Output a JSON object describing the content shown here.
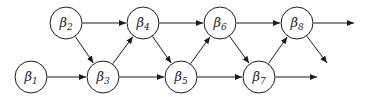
{
  "diagram": {
    "background_color": "#ffffff",
    "stroke_color": "#1c1c1c",
    "node_fill_color": "#ffffff",
    "node_radius": 16,
    "node_stroke_width": 1,
    "edge_stroke_width": 1,
    "label_font_size": 13,
    "subscript_font_size": 9,
    "canvas": {
      "width": 366,
      "height": 97
    },
    "nodes": [
      {
        "id": "beta1",
        "label": "β",
        "subscript": "1",
        "x": 31,
        "y": 77
      },
      {
        "id": "beta2",
        "label": "β",
        "subscript": "2",
        "x": 66,
        "y": 23
      },
      {
        "id": "beta3",
        "label": "β",
        "subscript": "3",
        "x": 103,
        "y": 77
      },
      {
        "id": "beta4",
        "label": "β",
        "subscript": "4",
        "x": 143,
        "y": 23
      },
      {
        "id": "beta5",
        "label": "β",
        "subscript": "5",
        "x": 181,
        "y": 77
      },
      {
        "id": "beta6",
        "label": "β",
        "subscript": "6",
        "x": 220,
        "y": 23
      },
      {
        "id": "beta7",
        "label": "β",
        "subscript": "7",
        "x": 259,
        "y": 77
      },
      {
        "id": "beta8",
        "label": "β",
        "subscript": "8",
        "x": 297,
        "y": 23
      }
    ],
    "edges": [
      {
        "from": "beta1",
        "to": "beta3"
      },
      {
        "from": "beta2",
        "to": "beta4"
      },
      {
        "from": "beta2",
        "to": "beta3"
      },
      {
        "from": "beta3",
        "to": "beta4"
      },
      {
        "from": "beta3",
        "to": "beta5"
      },
      {
        "from": "beta4",
        "to": "beta5"
      },
      {
        "from": "beta4",
        "to": "beta6"
      },
      {
        "from": "beta5",
        "to": "beta6"
      },
      {
        "from": "beta5",
        "to": "beta7"
      },
      {
        "from": "beta6",
        "to": "beta7"
      },
      {
        "from": "beta6",
        "to": "beta8"
      },
      {
        "from": "beta7",
        "to": "beta8"
      }
    ],
    "exit_arrows": [
      {
        "from": "beta7",
        "to_x": 317,
        "to_y": 77
      },
      {
        "from": "beta8",
        "to_x": 354,
        "to_y": 23
      },
      {
        "from": "beta8",
        "to_x": 327,
        "to_y": 63
      }
    ]
  }
}
